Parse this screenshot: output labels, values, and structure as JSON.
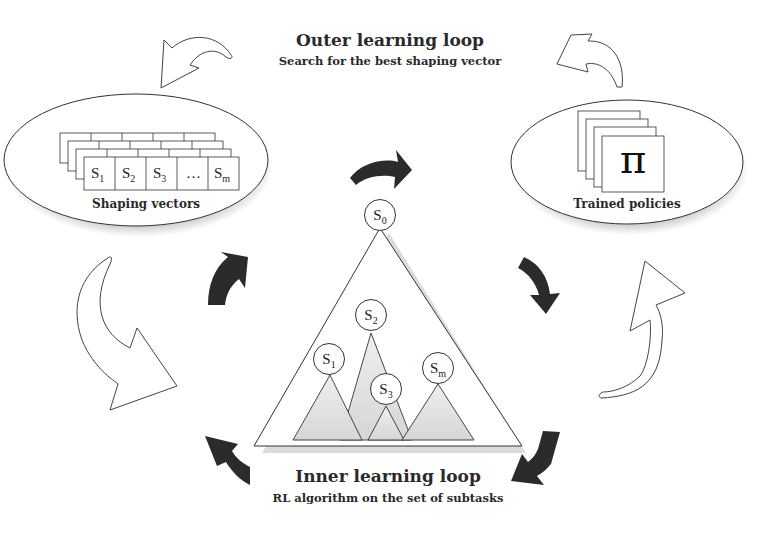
{
  "outer_loop": {
    "title": "Outer learning loop",
    "subtitle": "Search for the best shaping vector"
  },
  "inner_loop": {
    "title": "Inner learning loop",
    "subtitle": "RL algorithm on the set of subtasks"
  },
  "shaping_vectors": {
    "label": "Shaping vectors",
    "cells": [
      {
        "base": "S",
        "sub": "1"
      },
      {
        "base": "S",
        "sub": "2"
      },
      {
        "base": "S",
        "sub": "3"
      },
      {
        "base": "…",
        "sub": ""
      },
      {
        "base": "S",
        "sub": "m"
      }
    ]
  },
  "trained_policies": {
    "label": "Trained policies",
    "symbol": "π"
  },
  "tree": {
    "root": {
      "base": "S",
      "sub": "0"
    },
    "subtasks": [
      {
        "base": "S",
        "sub": "1"
      },
      {
        "base": "S",
        "sub": "2"
      },
      {
        "base": "S",
        "sub": "3"
      },
      {
        "base": "S",
        "sub": "m"
      }
    ]
  },
  "colors": {
    "dark_arrow": "#2b2b2b",
    "outline": "#333333",
    "subtree_fill": "#dcdcdc"
  }
}
